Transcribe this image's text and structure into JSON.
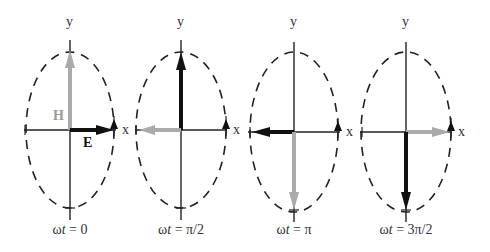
{
  "figure": {
    "colors": {
      "E": "#111111",
      "H": "#aaaaaa",
      "axis": "#222222",
      "ellipse": "#222222"
    },
    "axis_labels": {
      "x": "x",
      "y": "y"
    },
    "vector_labels": {
      "E": "E",
      "H": "H"
    },
    "panels": [
      {
        "id": "p0",
        "cx": 70,
        "cy": 130,
        "caption": "ωt = 0",
        "caption_parts": [
          "ω",
          "t",
          " = 0"
        ],
        "E_dir": "right",
        "H_dir": "up",
        "show_vector_labels": true
      },
      {
        "id": "p1",
        "cx": 181,
        "cy": 130,
        "caption": "ωt = π/2",
        "caption_parts": [
          "ω",
          "t",
          " = π/2"
        ],
        "E_dir": "up",
        "H_dir": "left",
        "show_vector_labels": false
      },
      {
        "id": "p2",
        "cx": 294,
        "cy": 132,
        "caption": "ωt = π",
        "caption_parts": [
          "ω",
          "t",
          " = π"
        ],
        "E_dir": "left",
        "H_dir": "down",
        "show_vector_labels": false
      },
      {
        "id": "p3",
        "cx": 406,
        "cy": 132,
        "caption": "ωt = 3π/2",
        "caption_parts": [
          "ω",
          "t",
          " = 3π/2"
        ],
        "E_dir": "down",
        "H_dir": "right",
        "show_vector_labels": false
      }
    ]
  }
}
